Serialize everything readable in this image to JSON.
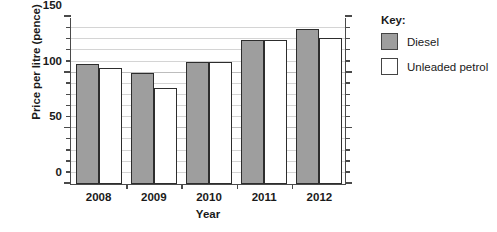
{
  "chart_data": {
    "type": "bar",
    "title": "",
    "xlabel": "Year",
    "ylabel": "Price per litre (pence)",
    "categories": [
      "2008",
      "2009",
      "2010",
      "2011",
      "2012"
    ],
    "series": [
      {
        "name": "Diesel",
        "color": "#9e9e9e",
        "values": [
          108,
          100,
          110,
          129,
          139
        ]
      },
      {
        "name": "Unleaded petrol",
        "color": "#ffffff",
        "values": [
          104,
          86,
          110,
          129,
          131
        ]
      }
    ],
    "ylim": [
      0,
      150
    ],
    "ytick_labels": [
      "0",
      "50",
      "100",
      "150"
    ],
    "ytick_values": [
      0,
      50,
      100,
      150
    ],
    "minor_tick_step": 10,
    "grid": true,
    "legend_position": "right"
  },
  "legend": {
    "title": "Key:",
    "entries": [
      {
        "label": "Diesel",
        "swatch": "diesel"
      },
      {
        "label": "Unleaded petrol",
        "swatch": "unleaded"
      }
    ]
  }
}
